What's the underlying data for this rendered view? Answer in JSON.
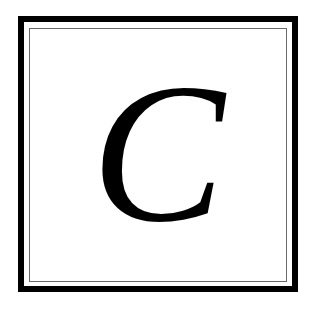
{
  "letter": "C",
  "colors": {
    "border": "#000000",
    "inner_line": "#6a6a6a",
    "background": "#ffffff",
    "glyph": "#000000"
  }
}
